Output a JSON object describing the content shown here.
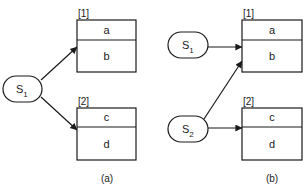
{
  "colors": {
    "line": "#1a1a1a",
    "background": "#ffffff"
  },
  "panel_a": {
    "caption": "(a)",
    "sources": [
      {
        "name": "S",
        "subscript": "1"
      }
    ],
    "blocks": [
      {
        "index_label": "[1]",
        "fields": [
          "a",
          "b"
        ]
      },
      {
        "index_label": "[2]",
        "fields": [
          "c",
          "d"
        ]
      }
    ],
    "edges": [
      {
        "from": "S1",
        "to": "[1]"
      },
      {
        "from": "S1",
        "to": "[2]"
      }
    ]
  },
  "panel_b": {
    "caption": "(b)",
    "sources": [
      {
        "name": "S",
        "subscript": "1"
      },
      {
        "name": "S",
        "subscript": "2"
      }
    ],
    "blocks": [
      {
        "index_label": "[1]",
        "fields": [
          "a",
          "b"
        ]
      },
      {
        "index_label": "[2]",
        "fields": [
          "c",
          "d"
        ]
      }
    ],
    "edges": [
      {
        "from": "S1",
        "to": "[1]"
      },
      {
        "from": "S2",
        "to": "[1]"
      },
      {
        "from": "S2",
        "to": "[2]"
      }
    ]
  }
}
